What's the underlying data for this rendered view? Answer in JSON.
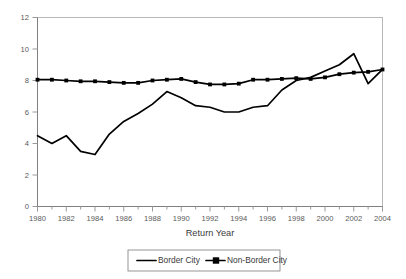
{
  "chart_data": {
    "type": "line",
    "title": "",
    "xlabel": "Return Year",
    "ylabel": "",
    "xlim": [
      1980,
      2004
    ],
    "ylim": [
      0,
      12
    ],
    "grid": false,
    "legend_position": "bottom",
    "x": [
      1980,
      1981,
      1982,
      1983,
      1984,
      1985,
      1986,
      1987,
      1988,
      1989,
      1990,
      1991,
      1992,
      1993,
      1994,
      1995,
      1996,
      1997,
      1998,
      1999,
      2000,
      2001,
      2002,
      2003,
      2004
    ],
    "xtick_labels": [
      "1980",
      "1982",
      "1984",
      "1986",
      "1988",
      "1990",
      "1992",
      "1994",
      "1996",
      "1998",
      "2000",
      "2002",
      "2004"
    ],
    "xtick_values": [
      1980,
      1982,
      1984,
      1986,
      1988,
      1990,
      1992,
      1994,
      1996,
      1998,
      2000,
      2002,
      2004
    ],
    "ytick_labels": [
      "0",
      "2",
      "4",
      "6",
      "8",
      "10",
      "12"
    ],
    "ytick_values": [
      0,
      2,
      4,
      6,
      8,
      10,
      12
    ],
    "series": [
      {
        "name": "Border City",
        "markers": false,
        "values": [
          4.5,
          4.0,
          4.5,
          3.5,
          3.3,
          4.6,
          5.4,
          5.9,
          6.5,
          7.3,
          6.9,
          6.4,
          6.3,
          6.0,
          6.0,
          6.3,
          6.4,
          7.4,
          8.0,
          8.2,
          8.6,
          9.0,
          9.7,
          7.8,
          8.7
        ]
      },
      {
        "name": "Non-Border City",
        "markers": true,
        "values": [
          8.05,
          8.05,
          8.0,
          7.95,
          7.95,
          7.9,
          7.85,
          7.85,
          8.0,
          8.05,
          8.1,
          7.9,
          7.75,
          7.75,
          7.8,
          8.05,
          8.05,
          8.1,
          8.15,
          8.1,
          8.2,
          8.4,
          8.5,
          8.55,
          8.7
        ]
      }
    ]
  },
  "legend": {
    "items": [
      {
        "label": "Border City"
      },
      {
        "label": "Non-Border City"
      }
    ]
  }
}
